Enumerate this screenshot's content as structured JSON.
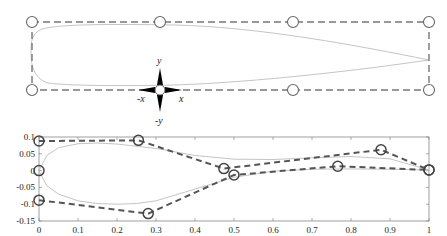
{
  "top_panel": {
    "description": "Airfoil enclosed in a dashed free-form deformation bounding box with control handles",
    "box": {
      "left": 32,
      "top": 22,
      "right": 429,
      "bottom": 90
    },
    "handles": [
      {
        "x": 32,
        "y": 22
      },
      {
        "x": 160,
        "y": 22
      },
      {
        "x": 293,
        "y": 22
      },
      {
        "x": 429,
        "y": 22
      },
      {
        "x": 32,
        "y": 90
      },
      {
        "x": 160,
        "y": 90
      },
      {
        "x": 293,
        "y": 90
      },
      {
        "x": 429,
        "y": 90
      }
    ],
    "move_gizmo": {
      "x": 160,
      "y": 90,
      "labels": {
        "up": "y",
        "down": "-y",
        "left": "-x",
        "right": "x"
      }
    },
    "colors": {
      "dash": "#777777",
      "airfoil": "#bbbbbb",
      "handle": "#555555",
      "gizmo": "#000000"
    }
  },
  "chart_data": {
    "type": "line",
    "title": "",
    "xlabel": "",
    "ylabel": "",
    "xlim": [
      0,
      1
    ],
    "ylim": [
      -0.15,
      0.1
    ],
    "x_ticks": [
      "0",
      "0.1",
      "0.2",
      "0.3",
      "0.4",
      "0.5",
      "0.6",
      "0.7",
      "0.8",
      "0.9",
      "1"
    ],
    "y_ticks": [
      "0.1",
      "0.05",
      "0",
      "-0.05",
      "-0.1",
      "-0.15"
    ],
    "grid": false,
    "legend": null,
    "series": [
      {
        "name": "upper control polygon",
        "style": "dashed, circle markers",
        "x": [
          0,
          0.255,
          0.474,
          0.877,
          1.0
        ],
        "y": [
          0.088,
          0.09,
          0.006,
          0.062,
          0.002
        ]
      },
      {
        "name": "lower control polygon",
        "style": "dashed, circle markers",
        "x": [
          0,
          0.28,
          0.5,
          0.766,
          1.0
        ],
        "y": [
          -0.088,
          -0.128,
          -0.013,
          0.013,
          0.002
        ]
      },
      {
        "name": "leading edge control point",
        "style": "circle marker",
        "x": [
          0
        ],
        "y": [
          0
        ]
      },
      {
        "name": "deformed airfoil upper surface",
        "style": "solid light gray",
        "x": [
          0,
          0.02,
          0.05,
          0.1,
          0.15,
          0.2,
          0.3,
          0.4,
          0.5,
          0.6,
          0.7,
          0.8,
          0.9,
          1.0
        ],
        "y": [
          0,
          0.045,
          0.068,
          0.08,
          0.082,
          0.079,
          0.066,
          0.045,
          0.034,
          0.033,
          0.038,
          0.042,
          0.035,
          0.002
        ]
      },
      {
        "name": "deformed airfoil lower surface",
        "style": "solid light gray",
        "x": [
          0,
          0.02,
          0.05,
          0.1,
          0.15,
          0.2,
          0.25,
          0.3,
          0.4,
          0.5,
          0.6,
          0.7,
          0.8,
          0.9,
          1.0
        ],
        "y": [
          0,
          -0.045,
          -0.07,
          -0.09,
          -0.098,
          -0.1,
          -0.098,
          -0.09,
          -0.055,
          -0.02,
          -0.002,
          0.004,
          0.005,
          0.004,
          0.002
        ]
      }
    ]
  }
}
